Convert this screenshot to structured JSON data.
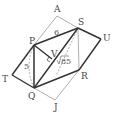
{
  "diagram": {
    "points": {
      "A": {
        "label": "A",
        "x": 57,
        "y": 16
      },
      "S": {
        "label": "S",
        "x": 78,
        "y": 28
      },
      "U": {
        "label": "U",
        "x": 101,
        "y": 39
      },
      "P": {
        "label": "P",
        "x": 34,
        "y": 45
      },
      "V": {
        "label": "V",
        "x": 52,
        "y": 59
      },
      "T": {
        "label": "T",
        "x": 12,
        "y": 75
      },
      "Q": {
        "label": "Q",
        "x": 34,
        "y": 88
      },
      "R": {
        "label": "R",
        "x": 79,
        "y": 70
      },
      "J": {
        "label": "J",
        "x": 55,
        "y": 100
      }
    },
    "measures": {
      "PS": "6",
      "PQ": "5",
      "QS_sqrt": "85"
    },
    "colors": {
      "thick": "#333333",
      "thin": "#999999",
      "dashed": "#999999"
    }
  }
}
